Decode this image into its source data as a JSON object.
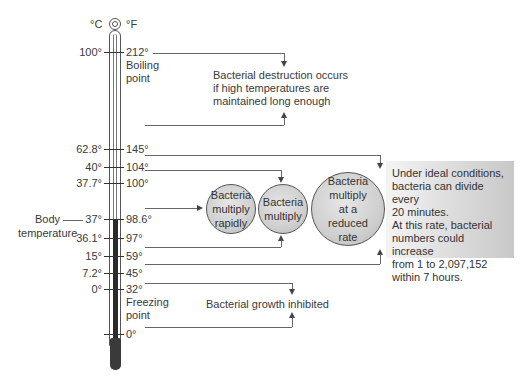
{
  "thermometer": {
    "celsius_unit": "°C",
    "fahrenheit_unit": "°F",
    "celsius_labels": [
      "100°",
      "62.8°",
      "40°",
      "37.7°",
      "37°",
      "36.1°",
      "15°",
      "7.2°",
      "0°"
    ],
    "fahrenheit_labels": [
      "212°",
      "145°",
      "104°",
      "100°",
      "98.6°",
      "97°",
      "59°",
      "45°",
      "32°",
      "0°"
    ],
    "boiling_point": "Boiling point",
    "boiling_line1": "Boiling",
    "boiling_line2": "point",
    "freezing_line1": "Freezing",
    "freezing_line2": "point",
    "body_temp_line1": "Body",
    "body_temp_line2": "temperature"
  },
  "annotations": {
    "destruction_line1": "Bacterial destruction occurs",
    "destruction_line2": "if high temperatures are",
    "destruction_line3": "maintained long enough",
    "growth_inhibited": "Bacterial growth inhibited"
  },
  "circles": [
    {
      "line1": "Bacteria",
      "line2": "multiply",
      "line3": "rapidly"
    },
    {
      "line1": "Bacteria",
      "line2": "multiply"
    },
    {
      "line1": "Bacteria",
      "line2": "multiply",
      "line3": "at a",
      "line4": "reduced",
      "line5": "rate"
    }
  ],
  "infobox": {
    "line1": "Under ideal conditions,",
    "line2": "bacteria can divide every",
    "line3": "20 minutes.",
    "line4": "At this rate, bacterial",
    "line5": "numbers could increase",
    "line6": "from 1 to 2,097,152",
    "line7": "within 7 hours."
  }
}
